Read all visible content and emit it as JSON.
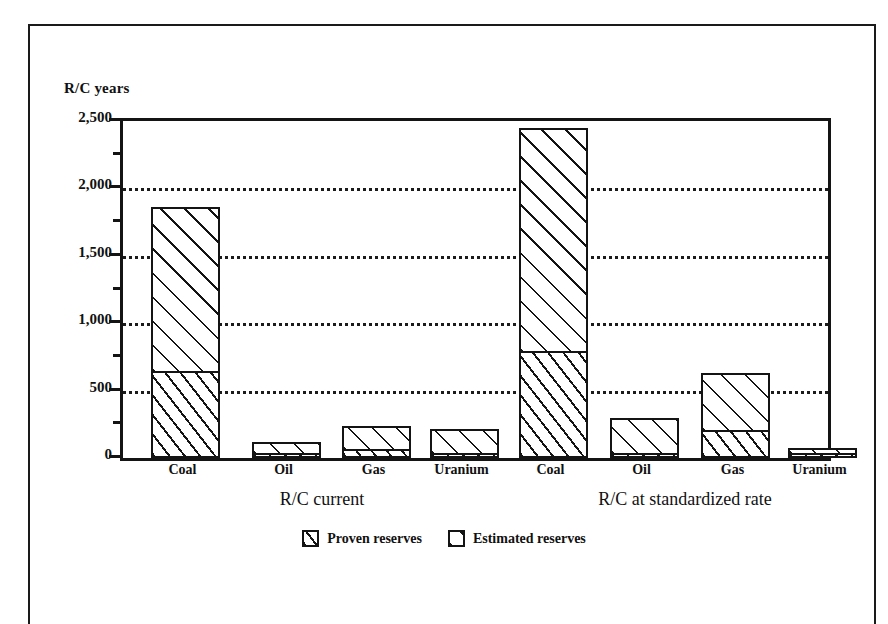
{
  "chart_data": {
    "type": "bar",
    "title": "",
    "subtitle": "",
    "xlabel": "",
    "ylabel": "R/C years",
    "ylim": [
      0,
      2500
    ],
    "ytick_labels": [
      "0",
      "500",
      "1,000",
      "1,500",
      "2,000",
      "2,500"
    ],
    "ytick_values": [
      0,
      500,
      1000,
      1500,
      2000,
      2500
    ],
    "yminor_values": [
      250,
      750,
      1250,
      1750,
      2250
    ],
    "grid": "horizontal-dotted",
    "stacked": true,
    "legend_position": "bottom-center",
    "legend": [
      "Proven reserves",
      "Estimated reserves"
    ],
    "groups": [
      {
        "name": "R/C current",
        "categories": [
          "Coal",
          "Oil",
          "Gas",
          "Uranium"
        ],
        "series": [
          {
            "name": "Proven reserves",
            "values": [
              645,
              25,
              70,
              20
            ]
          },
          {
            "name": "Estimated reserves",
            "values": [
              1215,
              85,
              170,
              180
            ]
          }
        ],
        "totals": [
          1860,
          110,
          240,
          200
        ]
      },
      {
        "name": "R/C at standardized rate",
        "categories": [
          "Coal",
          "Oil",
          "Gas",
          "Uranium"
        ],
        "series": [
          {
            "name": "Proven reserves",
            "values": [
              795,
              40,
              207,
              20
            ]
          },
          {
            "name": "Estimated reserves",
            "values": [
              1655,
              257,
              423,
              40
            ]
          }
        ],
        "totals": [
          2450,
          297,
          630,
          60
        ]
      }
    ]
  },
  "axis": {
    "y_title": "R/C years"
  },
  "legend": {
    "items": [
      {
        "label": "Proven reserves",
        "pattern": "proven"
      },
      {
        "label": "Estimated reserves",
        "pattern": "estimated"
      }
    ]
  },
  "colors": {
    "ink": "#141414",
    "paper": "#ffffff"
  }
}
